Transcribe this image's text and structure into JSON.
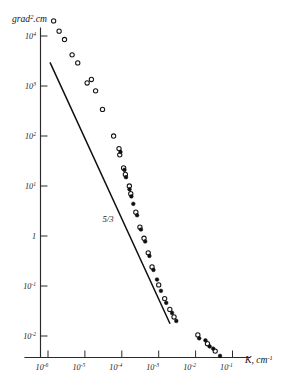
{
  "chart_data": {
    "type": "scatter",
    "title": "",
    "xlabel": "K, cm⁻¹",
    "ylabel": "grad².cm",
    "xscale": "log",
    "yscale": "log",
    "xlim": [
      1e-06,
      0.3
    ],
    "ylim": [
      0.003,
      30000.0
    ],
    "grid": false,
    "legend_position": "none",
    "x_ticks": [
      {
        "value": 1e-06,
        "label": "10",
        "exponent": "-6"
      },
      {
        "value": 1e-05,
        "label": "10",
        "exponent": "-5"
      },
      {
        "value": 0.0001,
        "label": "10",
        "exponent": "-4"
      },
      {
        "value": 0.001,
        "label": "10",
        "exponent": "-3"
      },
      {
        "value": 0.01,
        "label": "10",
        "exponent": "-2"
      },
      {
        "value": 0.1,
        "label": "10",
        "exponent": "-1"
      }
    ],
    "y_ticks": [
      {
        "value": 10000,
        "label": "10",
        "exponent": "4"
      },
      {
        "value": 1000,
        "label": "10",
        "exponent": "3"
      },
      {
        "value": 100,
        "label": "10",
        "exponent": "2"
      },
      {
        "value": 10,
        "label": "10",
        "exponent": "1"
      },
      {
        "value": 1,
        "label": "1",
        "exponent": ""
      },
      {
        "value": 0.1,
        "label": "10",
        "exponent": "-1"
      },
      {
        "value": 0.01,
        "label": "10",
        "exponent": "-2"
      }
    ],
    "annotations": [
      {
        "text": "5/3",
        "x": 3e-05,
        "y": 1.9,
        "name": "slope-annotation"
      }
    ],
    "reference_line": {
      "name": "minus-five-thirds-slope-line",
      "label": "5/3",
      "slope": -1.6667,
      "x_start": 1.15e-06,
      "y_start": 2900,
      "x_end": 0.002,
      "y_end": 0.018
    },
    "series": [
      {
        "name": "open-circles",
        "marker": "open-circle",
        "points": [
          [
            1.42e-06,
            20000.0
          ],
          [
            2e-06,
            12500.0
          ],
          [
            2.8e-06,
            8500.0
          ],
          [
            4.5e-06,
            4200.0
          ],
          [
            6.4e-06,
            2900.0
          ],
          [
            1.15e-05,
            1150.0
          ],
          [
            1.5e-05,
            1350.0
          ],
          [
            1.95e-05,
            800.0
          ],
          [
            3e-05,
            340.0
          ],
          [
            6e-05,
            100.0
          ],
          [
            8.4e-05,
            56.0
          ],
          [
            8.8e-05,
            42.0
          ],
          [
            0.000112,
            23.0
          ],
          [
            0.000125,
            17.0
          ],
          [
            0.00016,
            10.0
          ],
          [
            0.000175,
            7.0
          ],
          [
            0.00024,
            3.0
          ],
          [
            0.00031,
            1.5
          ],
          [
            0.0004,
            0.9
          ],
          [
            0.00052,
            0.46
          ],
          [
            0.00066,
            0.24
          ],
          [
            0.001,
            0.105
          ],
          [
            0.00145,
            0.056
          ],
          [
            0.002,
            0.034
          ],
          [
            0.0026,
            0.024
          ],
          [
            0.0115,
            0.0105
          ],
          [
            0.021,
            0.007
          ],
          [
            0.034,
            0.005
          ]
        ]
      },
      {
        "name": "filled-circles",
        "marker": "filled-circle",
        "points": [
          [
            9.2e-05,
            48.0
          ],
          [
            0.000118,
            21.0
          ],
          [
            0.00013,
            15.0
          ],
          [
            0.000162,
            8.6
          ],
          [
            0.000182,
            6.2
          ],
          [
            0.000205,
            4.4
          ],
          [
            0.00026,
            2.6
          ],
          [
            0.00033,
            1.35
          ],
          [
            0.00043,
            0.78
          ],
          [
            0.00056,
            0.4
          ],
          [
            0.00072,
            0.21
          ],
          [
            0.0009,
            0.135
          ],
          [
            0.00115,
            0.08
          ],
          [
            0.0016,
            0.046
          ],
          [
            0.0023,
            0.029
          ],
          [
            0.003,
            0.02
          ],
          [
            0.0125,
            0.009
          ],
          [
            0.0185,
            0.0082
          ],
          [
            0.024,
            0.0062
          ],
          [
            0.03,
            0.0056
          ],
          [
            0.046,
            0.004
          ]
        ]
      }
    ]
  }
}
